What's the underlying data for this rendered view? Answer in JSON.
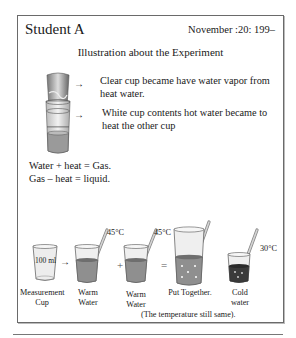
{
  "header": {
    "student": "Student A",
    "date": "November :20: 199–"
  },
  "title": "Illustration about the Experiment",
  "stacked_cups": {
    "clear_cup_note": "Clear cup became have water vapor from heat water.",
    "white_cup_note": "White cup contents hot water became to heat the other cup",
    "arrow_glyph": "→"
  },
  "equations": {
    "line1": "Water + heat = Gas.",
    "line2": "Gas – heat = liquid."
  },
  "diagram": {
    "measurement_cup": {
      "label": "Measurement Cup",
      "volume": "100 ml"
    },
    "arrow_glyph": "→",
    "warm_water_1": {
      "label": "Warm Water",
      "temp": "45°C"
    },
    "plus": "+",
    "warm_water_2": {
      "label": "Warm Water",
      "temp": "45°C"
    },
    "equals": "=",
    "put_together": {
      "label": "Put Together."
    },
    "cold_water": {
      "label": "Cold water",
      "temp": "30°C"
    },
    "footnote": "(The temperature still same)."
  },
  "colors": {
    "border": "#6a6a6a",
    "water_warm": "#8f8f8f",
    "water_cold": "#3a3a3a",
    "glass": "#e6e6e6",
    "thermometer": "#b5b5b5"
  }
}
